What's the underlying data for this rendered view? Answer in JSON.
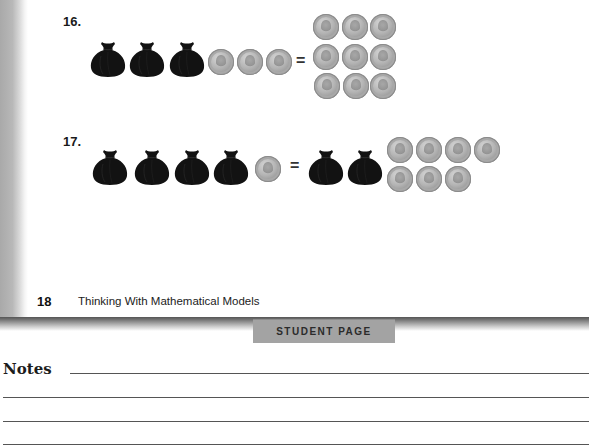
{
  "problems": [
    {
      "number": "16.",
      "left_side": {
        "bags": 3,
        "coins": 3
      },
      "equals": "=",
      "right_side": {
        "bags": 0,
        "coins": 9,
        "layout": "3x3 grid"
      }
    },
    {
      "number": "17.",
      "left_side": {
        "bags": 4,
        "coins": 1
      },
      "equals": "=",
      "right_side": {
        "bags": 2,
        "coins": 7,
        "layout": "rows of 4 and 3"
      }
    }
  ],
  "footer": {
    "page_number": "18",
    "book_title": "Thinking With Mathematical Models"
  },
  "tab": {
    "label": "STUDENT PAGE"
  },
  "notes": {
    "label": "Notes",
    "line_count": 4
  },
  "icons": {
    "bag": "money-bag-icon",
    "coin": "coin-icon"
  },
  "colors": {
    "bag": "#111111",
    "coin": "#a8a8a8",
    "tab_background": "#a3a3a3",
    "page_edge": "#b0b0b0"
  }
}
